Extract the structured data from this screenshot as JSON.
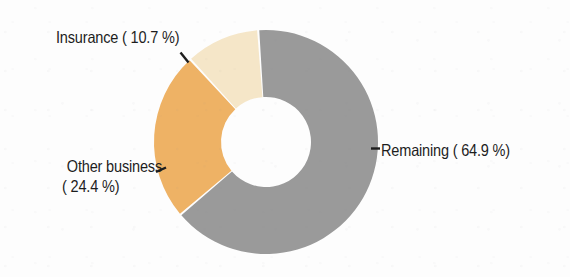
{
  "chart_data": {
    "type": "pie",
    "variant": "donut",
    "title": "",
    "subtitle": "",
    "xlabel": "",
    "ylabel": "",
    "unit": "%",
    "legend_position": "none",
    "labels_position": "outside-with-leader-lines",
    "grid": false,
    "total": 100.0,
    "categories": [
      "Remaining",
      "Other business",
      "Insurance"
    ],
    "values": [
      64.9,
      24.4,
      10.7
    ],
    "slices": [
      {
        "name": "Remaining",
        "value": 64.9,
        "display": "Remaining ( 64.9 %)",
        "label_text": "Remaining ( 64.9 %)",
        "color": "#9a9a9a"
      },
      {
        "name": "Other business",
        "value": 24.4,
        "display": "Other business ( 24.4 %)",
        "label_line1": "Other business",
        "label_line2": "( 24.4 %)",
        "color": "#eeb265"
      },
      {
        "name": "Insurance",
        "value": 10.7,
        "display": "Insurance ( 10.7 %)",
        "label_text": "Insurance ( 10.7 %)",
        "color": "#f5e6c8"
      }
    ]
  },
  "chart": {
    "background_color": "#fdfdfd",
    "text_color": "#1d1d1d",
    "leader_line_color": "#1d1d1d",
    "hole_color": "#ffffff",
    "center_x": 266,
    "center_y": 142,
    "outer_radius": 112,
    "inner_radius": 45,
    "start_angle_deg": -4,
    "direction": "clockwise"
  },
  "labels": {
    "insurance": "Insurance ( 10.7 %)",
    "remaining": "Remaining ( 64.9 %)",
    "other_business_line1": "Other business",
    "other_business_line2": "( 24.4 %)"
  },
  "leader_dashes": {
    "remaining": "-",
    "other_business": "-"
  }
}
